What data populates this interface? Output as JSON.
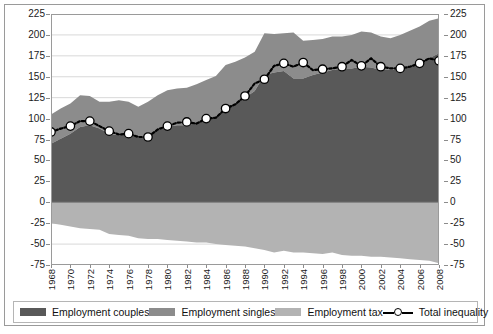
{
  "chart_data": {
    "type": "area",
    "title": "",
    "subtitle": "",
    "xlabel": "",
    "ylabel": "",
    "ylim": [
      -75,
      225
    ],
    "ytick_step": 25,
    "yticks": [
      225,
      200,
      175,
      150,
      125,
      100,
      75,
      50,
      25,
      0,
      -25,
      -50,
      -75
    ],
    "ytick_labels": [
      "225",
      "200",
      "175",
      "150",
      "125",
      "100",
      "75",
      "50",
      "25",
      "0",
      "-25",
      "-50",
      "-75"
    ],
    "dual_y_axis": true,
    "grid": true,
    "legend_position": "bottom",
    "x": [
      1968,
      1969,
      1970,
      1971,
      1972,
      1973,
      1974,
      1975,
      1976,
      1977,
      1978,
      1979,
      1980,
      1981,
      1982,
      1983,
      1984,
      1985,
      1986,
      1987,
      1988,
      1989,
      1990,
      1991,
      1992,
      1993,
      1994,
      1995,
      1996,
      1997,
      1998,
      1999,
      2000,
      2001,
      2002,
      2003,
      2004,
      2005,
      2006,
      2007,
      2008
    ],
    "xtick_labels": [
      "1968",
      "1970",
      "1972",
      "1974",
      "1976",
      "1978",
      "1980",
      "1982",
      "1984",
      "1986",
      "1988",
      "1990",
      "1992",
      "1994",
      "1996",
      "1998",
      "2000",
      "2002",
      "2004",
      "2006",
      "2008"
    ],
    "xtick_step": 2,
    "xtick_rotation": 90,
    "series": [
      {
        "name": "Employment couples",
        "type": "area-stacked",
        "color": "#595959",
        "values": [
          70,
          76,
          82,
          90,
          92,
          88,
          82,
          80,
          82,
          77,
          80,
          86,
          90,
          92,
          92,
          95,
          98,
          103,
          112,
          118,
          125,
          133,
          152,
          155,
          157,
          148,
          148,
          152,
          155,
          158,
          160,
          160,
          162,
          161,
          158,
          158,
          160,
          163,
          168,
          172,
          178
        ]
      },
      {
        "name": "Employment singles",
        "type": "area-stacked",
        "color": "#8c8c8c",
        "values": [
          35,
          36,
          36,
          38,
          35,
          32,
          38,
          42,
          38,
          37,
          40,
          42,
          44,
          44,
          45,
          46,
          48,
          48,
          52,
          50,
          48,
          47,
          50,
          46,
          45,
          55,
          45,
          42,
          40,
          40,
          38,
          40,
          42,
          42,
          40,
          38,
          40,
          42,
          42,
          45,
          42
        ]
      },
      {
        "name": "Employment tax",
        "type": "area-negative",
        "color": "#b3b3b3",
        "values": [
          -25,
          -27,
          -29,
          -31,
          -32,
          -33,
          -38,
          -39,
          -40,
          -43,
          -44,
          -44,
          -45,
          -46,
          -47,
          -48,
          -48,
          -50,
          -51,
          -52,
          -53,
          -55,
          -57,
          -60,
          -58,
          -60,
          -60,
          -61,
          -62,
          -60,
          -63,
          -64,
          -64,
          -65,
          -65,
          -66,
          -67,
          -68,
          -69,
          -70,
          -73
        ]
      },
      {
        "name": "Total inequality",
        "type": "line",
        "color": "#000000",
        "marker": "circle-open",
        "values": [
          84,
          88,
          91,
          97,
          97,
          91,
          85,
          81,
          82,
          78,
          78,
          87,
          91,
          95,
          96,
          94,
          100,
          101,
          112,
          117,
          127,
          142,
          147,
          163,
          166,
          162,
          167,
          158,
          159,
          160,
          162,
          170,
          163,
          172,
          162,
          160,
          160,
          162,
          166,
          172,
          169
        ]
      }
    ]
  },
  "legend": {
    "items": [
      {
        "label": "Employment couples",
        "color": "#595959",
        "marker": "swatch"
      },
      {
        "label": "Employment singles",
        "color": "#8c8c8c",
        "marker": "swatch"
      },
      {
        "label": "Employment tax",
        "color": "#b3b3b3",
        "marker": "swatch"
      },
      {
        "label": "Total inequality",
        "color": "#000000",
        "marker": "line-circle"
      }
    ]
  }
}
